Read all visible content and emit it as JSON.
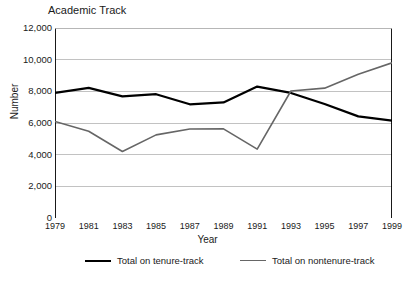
{
  "chart_data": {
    "type": "line",
    "title": "Academic Track",
    "xlabel": "Year",
    "ylabel": "Number",
    "x": [
      1979,
      1981,
      1983,
      1985,
      1987,
      1989,
      1991,
      1993,
      1995,
      1997,
      1999
    ],
    "xtick_labels": [
      "1979",
      "1981",
      "1983",
      "1985",
      "1987",
      "1989",
      "1991",
      "1993",
      "1995",
      "1997",
      "1999"
    ],
    "ytick_labels": [
      "12,000",
      "10,000",
      "8,000",
      "6,000",
      "4,000",
      "2,000",
      "0"
    ],
    "ytick_values": [
      12000,
      10000,
      8000,
      6000,
      4000,
      2000,
      0
    ],
    "xlim": [
      1979,
      1999
    ],
    "ylim": [
      0,
      12000
    ],
    "grid": "horizontal",
    "legend_position": "bottom",
    "series": [
      {
        "name": "Total on tenure-track",
        "color": "#000000",
        "width": 2.2,
        "values": [
          7900,
          8220,
          7680,
          7820,
          7180,
          7300,
          8300,
          7900,
          7200,
          6420,
          6150
        ]
      },
      {
        "name": "Total on nontenure-track",
        "color": "#666666",
        "width": 1.6,
        "values": [
          6100,
          5480,
          4200,
          5250,
          5620,
          5630,
          4350,
          8020,
          8200,
          9080,
          9800
        ]
      }
    ]
  }
}
